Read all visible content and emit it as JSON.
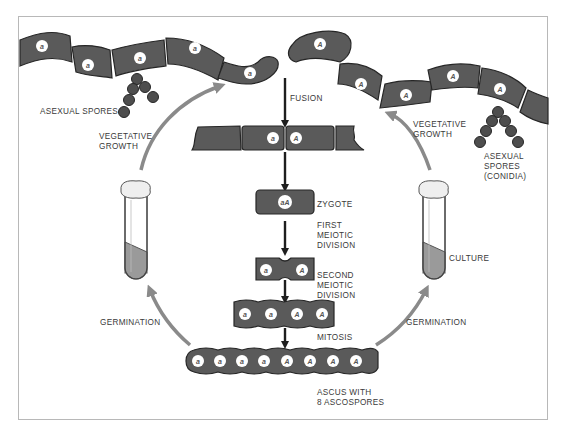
{
  "colors": {
    "cell_fill": "#5a5a5a",
    "cell_stroke": "#262626",
    "nucleus_fill": "#ffffff",
    "spore_fill": "#4e4e4e",
    "cycle_arrow": "#8a8a8a",
    "flow_arrow": "#1e1e1e",
    "frame": "#b8b8b8",
    "tube_liquid": "#9a9a9a",
    "label": "#3a3a3a"
  },
  "labels": {
    "asexual_spores_left": "ASEXUAL SPORES",
    "vegetative_growth_left": "VEGETATIVE\nGROWTH",
    "fusion": "FUSION",
    "vegetative_growth_right": "VEGETATIVE\nGROWTH",
    "asexual_spores_conidia": "ASEXUAL\nSPORES\n(CONIDIA)",
    "zygote": "ZYGOTE",
    "first_meiotic_division": "FIRST\nMEIOTIC\nDIVISION",
    "second_meiotic_division": "SECOND\nMEIOTIC\nDIVISION",
    "culture": "CULTURE",
    "germination_left": "GERMINATION",
    "germination_right": "GERMINATION",
    "mitosis": "MITOSIS",
    "ascus": "ASCUS WITH\n8 ASCOSPORES"
  },
  "nuclei": {
    "hypha_left": [
      "a",
      "a",
      "a",
      "a",
      "a"
    ],
    "hypha_right": [
      "A",
      "A",
      "A",
      "A",
      "A"
    ],
    "fusion_pair": [
      "a",
      "A"
    ],
    "zygote": "aA",
    "first_division": [
      "a",
      "A"
    ],
    "second_division": [
      "a",
      "a",
      "A",
      "A"
    ],
    "ascus": [
      "a",
      "a",
      "a",
      "a",
      "A",
      "A",
      "A",
      "A"
    ]
  }
}
